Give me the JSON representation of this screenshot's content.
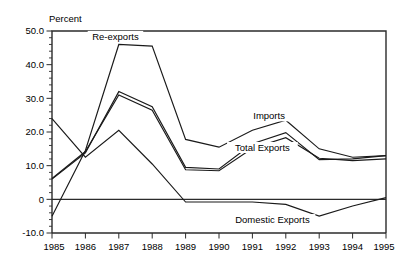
{
  "chart_data": {
    "type": "line",
    "title": "",
    "subtitle": "",
    "unit_label": "Percent",
    "xlabel": "",
    "ylabel": "",
    "grid": false,
    "legend_position": "inline-annotations",
    "x": [
      1985,
      1986,
      1987,
      1988,
      1989,
      1990,
      1991,
      1992,
      1993,
      1994,
      1995
    ],
    "xlim": [
      1985,
      1995
    ],
    "ylim": [
      -10.0,
      50.0
    ],
    "ytick_labels": [
      "50.0",
      "40.0",
      "30.0",
      "20.0",
      "10.0",
      "0",
      "-10.0"
    ],
    "ytick_values": [
      50.0,
      40.0,
      30.0,
      20.0,
      10.0,
      0.0,
      -10.0
    ],
    "xtick_labels": [
      "1985",
      "1986",
      "1987",
      "1988",
      "1989",
      "1990",
      "1991",
      "1992",
      "1993",
      "1994",
      "1995"
    ],
    "minor_tick_interval": 2.0,
    "series": [
      {
        "name": "Re-exports",
        "values": [
          -5.0,
          14.5,
          46.0,
          45.5,
          17.8,
          15.5,
          20.5,
          23.5,
          15.0,
          12.5,
          13.0
        ]
      },
      {
        "name": "Imports",
        "values": [
          6.0,
          13.8,
          32.0,
          27.5,
          9.5,
          9.0,
          16.5,
          19.8,
          11.8,
          12.0,
          13.0
        ]
      },
      {
        "name": "Total Exports",
        "values": [
          6.2,
          14.2,
          31.0,
          26.5,
          8.8,
          8.5,
          15.2,
          18.3,
          12.2,
          11.5,
          12.0
        ]
      },
      {
        "name": "Domestic Exports",
        "values": [
          24.0,
          12.5,
          20.5,
          10.5,
          -0.8,
          -0.8,
          -0.8,
          -1.5,
          -5.0,
          -2.0,
          0.5
        ]
      }
    ],
    "annotations": [
      {
        "text": "Re-exports",
        "x": 1986.9,
        "y": 47.8
      },
      {
        "text": "Imports",
        "x": 1991.5,
        "y": 24.2
      },
      {
        "text": "Total Exports",
        "x": 1991.3,
        "y": 14.8
      },
      {
        "text": "Domestic Exports",
        "x": 1991.6,
        "y": -6.6
      }
    ],
    "colors": {
      "line": "#1a1a1a",
      "frame": "#2b2b2b",
      "background": "#ffffff",
      "text": "#000000"
    }
  }
}
